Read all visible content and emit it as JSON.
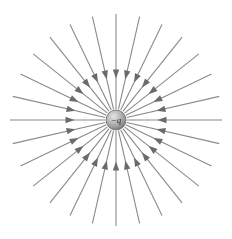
{
  "figure": {
    "name": "electric-field-lines-negative-point-charge",
    "background_color": "#ffffff",
    "width": 232,
    "height": 239
  },
  "charge": {
    "label": "−q",
    "sign": "negative",
    "center_x": 116,
    "center_y": 120,
    "radius": 10,
    "fill_light": "#d8d8d8",
    "fill_mid": "#a8a8a8",
    "fill_dark": "#6f6f6f",
    "stroke_color": "#707070",
    "label_color": "#2d2d2d"
  },
  "field_lines": {
    "count": 28,
    "direction": "inward",
    "angle_step_degrees": 12.857,
    "inner_radius": 11,
    "outer_radius": 106,
    "line_color": "#8a8a8a",
    "line_width": 1.1,
    "arrow_color": "#6b6b6b",
    "arrow_position_radius": 46,
    "arrow_length": 9,
    "arrow_half_width": 3.2,
    "angles_degrees": [
      0,
      12.857,
      25.714,
      38.571,
      51.429,
      64.286,
      77.143,
      90,
      102.857,
      115.714,
      128.571,
      141.429,
      154.286,
      167.143,
      180,
      192.857,
      205.714,
      218.571,
      231.429,
      244.286,
      257.143,
      270,
      282.857,
      295.714,
      308.571,
      321.429,
      334.286,
      347.143
    ]
  },
  "chart_data": {
    "type": "scatter",
    "xlabel": "",
    "ylabel": "",
    "center": [
      116,
      120
    ],
    "line_count": 28,
    "arrow_direction": "inward",
    "series": [
      {
        "name": "field-line-angles-degrees",
        "values": [
          0,
          12.857,
          25.714,
          38.571,
          51.429,
          64.286,
          77.143,
          90,
          102.857,
          115.714,
          128.571,
          141.429,
          154.286,
          167.143,
          180,
          192.857,
          205.714,
          218.571,
          231.429,
          244.286,
          257.143,
          270,
          282.857,
          295.714,
          308.571,
          321.429,
          334.286,
          347.143
        ]
      }
    ]
  }
}
